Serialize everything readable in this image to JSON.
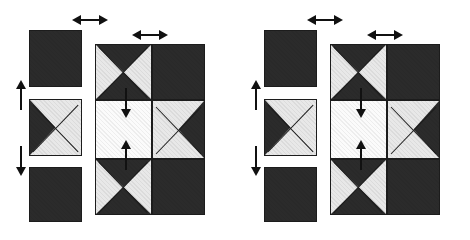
{
  "figure": {
    "type": "diagram",
    "kind": "tiling-motion-illusion",
    "canvas": {
      "width": 470,
      "height": 240,
      "background": "#ffffff"
    },
    "colors": {
      "dark": "#2b2b2b",
      "dark_outline": "#1c1c1c",
      "light": "#e8e8e8",
      "white": "#fbfbfb",
      "arrow": "#111111"
    },
    "panel_count": 2,
    "panels": [
      {
        "name": "left-panel",
        "origin_x": 0,
        "loose_tiles": [
          {
            "name": "tile-top",
            "pattern": "solid-dark",
            "x": 29,
            "y": 30,
            "w": 53,
            "h": 57
          },
          {
            "name": "tile-middle",
            "pattern": "x-split-dark-left",
            "x": 29,
            "y": 99,
            "w": 53,
            "h": 57
          },
          {
            "name": "tile-bottom",
            "pattern": "solid-dark",
            "x": 29,
            "y": 167,
            "w": 53,
            "h": 55
          }
        ],
        "grid": {
          "name": "main-grid",
          "x": 95,
          "y": 44,
          "w": 110,
          "h": 171,
          "cols": 2,
          "rows": 3,
          "col_widths": [
            57,
            53
          ],
          "row_heights": [
            56,
            59,
            56
          ],
          "cells": [
            {
              "row": 0,
              "col": 0,
              "pattern": "bowtie-dark-vertical"
            },
            {
              "row": 0,
              "col": 1,
              "pattern": "solid-dark"
            },
            {
              "row": 1,
              "col": 0,
              "pattern": "plain-white"
            },
            {
              "row": 1,
              "col": 1,
              "pattern": "x-split-dark-right"
            },
            {
              "row": 2,
              "col": 0,
              "pattern": "bowtie-dark-vertical"
            },
            {
              "row": 2,
              "col": 1,
              "pattern": "solid-dark"
            }
          ]
        },
        "arrows": [
          {
            "name": "arrow-tiles-up",
            "style": "single-up",
            "x": 14,
            "y": 80,
            "w": 13,
            "h": 30
          },
          {
            "name": "arrow-tiles-down",
            "style": "single-down",
            "x": 14,
            "y": 146,
            "w": 13,
            "h": 30
          },
          {
            "name": "arrow-tiles-horizontal",
            "style": "double-horizontal",
            "x": 72,
            "y": 13,
            "w": 36,
            "h": 14
          },
          {
            "name": "arrow-grid-horizontal",
            "style": "double-horizontal",
            "x": 132,
            "y": 28,
            "w": 36,
            "h": 14
          },
          {
            "name": "arrow-center-down",
            "style": "single-down",
            "x": 119,
            "y": 88,
            "w": 13,
            "h": 30
          },
          {
            "name": "arrow-center-up",
            "style": "single-up",
            "x": 119,
            "y": 140,
            "w": 13,
            "h": 30
          }
        ]
      },
      {
        "name": "right-panel",
        "origin_x": 235,
        "loose_tiles": [
          {
            "name": "tile-top",
            "pattern": "solid-dark",
            "x": 29,
            "y": 30,
            "w": 53,
            "h": 57
          },
          {
            "name": "tile-middle",
            "pattern": "x-split-dark-left",
            "x": 29,
            "y": 99,
            "w": 53,
            "h": 57
          },
          {
            "name": "tile-bottom",
            "pattern": "solid-dark",
            "x": 29,
            "y": 167,
            "w": 53,
            "h": 55
          }
        ],
        "grid": {
          "name": "main-grid",
          "x": 95,
          "y": 44,
          "w": 110,
          "h": 171,
          "cols": 2,
          "rows": 3,
          "col_widths": [
            57,
            53
          ],
          "row_heights": [
            56,
            59,
            56
          ],
          "cells": [
            {
              "row": 0,
              "col": 0,
              "pattern": "bowtie-dark-vertical"
            },
            {
              "row": 0,
              "col": 1,
              "pattern": "solid-dark"
            },
            {
              "row": 1,
              "col": 0,
              "pattern": "plain-white"
            },
            {
              "row": 1,
              "col": 1,
              "pattern": "x-split-dark-right"
            },
            {
              "row": 2,
              "col": 0,
              "pattern": "bowtie-dark-vertical"
            },
            {
              "row": 2,
              "col": 1,
              "pattern": "solid-dark"
            }
          ]
        },
        "arrows": [
          {
            "name": "arrow-tiles-up",
            "style": "single-up",
            "x": 14,
            "y": 80,
            "w": 13,
            "h": 30
          },
          {
            "name": "arrow-tiles-down",
            "style": "single-down",
            "x": 14,
            "y": 146,
            "w": 13,
            "h": 30
          },
          {
            "name": "arrow-tiles-horizontal",
            "style": "double-horizontal",
            "x": 72,
            "y": 13,
            "w": 36,
            "h": 14
          },
          {
            "name": "arrow-grid-horizontal",
            "style": "double-horizontal",
            "x": 132,
            "y": 28,
            "w": 36,
            "h": 14
          },
          {
            "name": "arrow-center-down",
            "style": "single-down",
            "x": 119,
            "y": 88,
            "w": 13,
            "h": 30
          },
          {
            "name": "arrow-center-up",
            "style": "single-up",
            "x": 119,
            "y": 140,
            "w": 13,
            "h": 30
          }
        ]
      }
    ]
  }
}
